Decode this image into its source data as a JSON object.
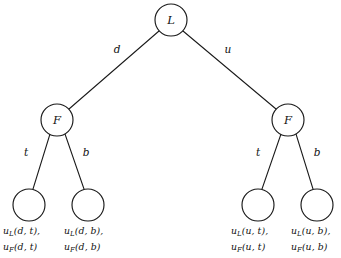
{
  "figure": {
    "type": "game-tree-diagram",
    "width": 341,
    "height": 258,
    "background_color": "#ffffff",
    "line_color": "#1a1a1a",
    "text_color": "#111111"
  },
  "nodes": {
    "root": {
      "label": "L",
      "cx": 171,
      "cy": 20,
      "r": 16
    },
    "left_internal": {
      "label": "F",
      "cx": 57,
      "cy": 120,
      "r": 16
    },
    "right_internal": {
      "label": "F",
      "cx": 288,
      "cy": 120,
      "r": 16
    },
    "leaf_1": {
      "label": "",
      "cx": 29,
      "cy": 205,
      "r": 16
    },
    "leaf_2": {
      "label": "",
      "cx": 88,
      "cy": 205,
      "r": 16
    },
    "leaf_3": {
      "label": "",
      "cx": 258,
      "cy": 205,
      "r": 16
    },
    "leaf_4": {
      "label": "",
      "cx": 317,
      "cy": 205,
      "r": 16
    }
  },
  "edge_labels": {
    "root_left": {
      "text": "d",
      "x": 117,
      "y": 50
    },
    "root_right": {
      "text": "u",
      "x": 228,
      "y": 50
    },
    "left_t": {
      "text": "t",
      "x": 26,
      "y": 153
    },
    "left_b": {
      "text": "b",
      "x": 86,
      "y": 153
    },
    "right_t": {
      "text": "t",
      "x": 258,
      "y": 153
    },
    "right_b": {
      "text": "b",
      "x": 317,
      "y": 153
    }
  },
  "payoffs": [
    {
      "id": "payoff-d-t",
      "line1_fn": "u",
      "line1_sub": "L",
      "line1_args": "(d, t),",
      "line2_fn": "u",
      "line2_sub": "F",
      "line2_args": "(d, t)",
      "x": 3,
      "y": 224
    },
    {
      "id": "payoff-d-b",
      "line1_fn": "u",
      "line1_sub": "L",
      "line1_args": "(d, b),",
      "line2_fn": "u",
      "line2_sub": "F",
      "line2_args": "(d, b)",
      "x": 64,
      "y": 224
    },
    {
      "id": "payoff-u-t",
      "line1_fn": "u",
      "line1_sub": "L",
      "line1_args": "(u, t),",
      "line2_fn": "u",
      "line2_sub": "F",
      "line2_args": "(u, t)",
      "x": 231,
      "y": 224
    },
    {
      "id": "payoff-u-b",
      "line1_fn": "u",
      "line1_sub": "L",
      "line1_args": "(u, b),",
      "line2_fn": "u",
      "line2_sub": "F",
      "line2_args": "(u, b)",
      "x": 291,
      "y": 224
    }
  ]
}
